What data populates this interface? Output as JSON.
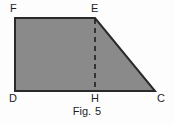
{
  "figure": {
    "caption_prefix": "Fig.",
    "caption_number": "5",
    "colors": {
      "fill": "#8a8a8a",
      "stroke": "#2a2a2a",
      "background": "#fdfdfd",
      "dashed_line": "#1e1e1e",
      "text": "#1e1e1e"
    },
    "vertices": [
      {
        "id": "F",
        "label": "F",
        "x": 15,
        "y": 18
      },
      {
        "id": "E",
        "label": "E",
        "x": 95,
        "y": 18
      },
      {
        "id": "C",
        "label": "C",
        "x": 155,
        "y": 91
      },
      {
        "id": "D",
        "label": "D",
        "x": 15,
        "y": 91
      }
    ],
    "foot_point": {
      "id": "H",
      "label": "H",
      "x": 95,
      "y": 91
    },
    "labels": {
      "F": "F",
      "E": "E",
      "D": "D",
      "H": "H",
      "C": "C"
    },
    "polygon_points": "15,18 95,18 155,91 15,91",
    "dashed_segment": {
      "x1": 95,
      "y1": 18,
      "x2": 95,
      "y2": 91
    }
  }
}
